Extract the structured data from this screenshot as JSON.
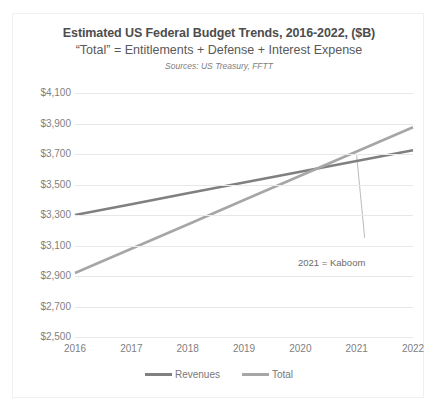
{
  "top_strip": {
    "ghost_left": "··",
    "ghost_right": "·"
  },
  "chart_data": {
    "type": "line",
    "title": "Estimated US Federal Budget Trends, 2016-2022, ($B)",
    "subtitle": "“Total” = Entitlements + Defense + Interest Expense",
    "source": "Sources: US Treasury, FFTT",
    "xlabel": "",
    "ylabel": "",
    "categories": [
      "2016",
      "2017",
      "2018",
      "2019",
      "2020",
      "2021",
      "2022"
    ],
    "x": [
      2016,
      2017,
      2018,
      2019,
      2020,
      2021,
      2022
    ],
    "ylim": [
      2500,
      4100
    ],
    "xlim": [
      2016,
      2022
    ],
    "ytick_labels": [
      "$4,100",
      "$3,900",
      "$3,700",
      "$3,500",
      "$3,300",
      "$3,100",
      "$2,900",
      "$2,700",
      "$2,500"
    ],
    "ytick_values": [
      4100,
      3900,
      3700,
      3500,
      3300,
      3100,
      2900,
      2700,
      2500
    ],
    "grid": true,
    "legend_position": "bottom",
    "series": [
      {
        "name": "Revenues",
        "color": "#808080",
        "values": [
          3300,
          3371,
          3442,
          3513,
          3583,
          3654,
          3725
        ]
      },
      {
        "name": "Total",
        "color": "#a6a6a6",
        "values": [
          2920,
          3079,
          3238,
          3398,
          3557,
          3716,
          3875
        ]
      }
    ],
    "annotations": [
      {
        "text": "2021 = Kaboom",
        "x": 2021,
        "leader_from": 3690,
        "leader_to": 3150,
        "color": "#6b6b6b"
      }
    ]
  },
  "legend": {
    "items": [
      {
        "label": "Revenues",
        "color": "#808080"
      },
      {
        "label": "Total",
        "color": "#a6a6a6"
      }
    ]
  }
}
